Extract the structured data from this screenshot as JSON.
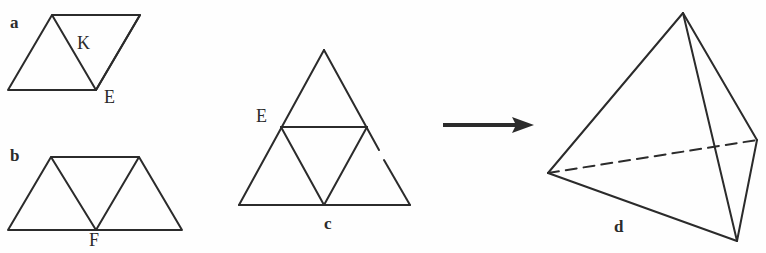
{
  "figure": {
    "stroke_color": "#2b2b2b",
    "background_color": "#ffffff",
    "panels": [
      {
        "id": "a",
        "letter": "a",
        "shape": "rhombus-two-triangles",
        "vertex_labels": [
          "K",
          "E"
        ]
      },
      {
        "id": "b",
        "letter": "b",
        "shape": "trapezoid-three-triangles",
        "vertex_labels": [
          "F"
        ]
      },
      {
        "id": "c",
        "letter": "c",
        "shape": "triangle-four-triangles",
        "vertex_labels": [
          "E"
        ]
      },
      {
        "id": "d",
        "letter": "d",
        "shape": "tetrahedron",
        "vertex_labels": []
      }
    ],
    "labels": {
      "panel_a": "a",
      "panel_b": "b",
      "panel_c": "c",
      "panel_d": "d",
      "vertex_K": "K",
      "vertex_E_a": "E",
      "vertex_F_b": "F",
      "vertex_E_c": "E"
    },
    "arrow": {
      "name": "transformation-arrow",
      "direction": "right",
      "from_panel": "c",
      "to_panel": "d"
    }
  }
}
